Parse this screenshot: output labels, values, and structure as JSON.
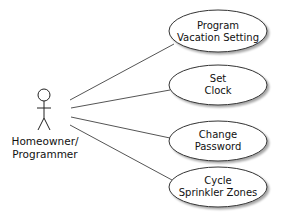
{
  "diagram": {
    "type": "use-case",
    "actor": {
      "label_line1": "Homeowner/",
      "label_line2": "Programmer"
    },
    "use_cases": [
      {
        "line1": "Program",
        "line2": "Vacation Setting"
      },
      {
        "line1": "Set",
        "line2": "Clock"
      },
      {
        "line1": "Change",
        "line2": "Password"
      },
      {
        "line1": "Cycle",
        "line2": "Sprinkler Zones"
      }
    ],
    "colors": {
      "stroke": "#333333",
      "fill": "#ffffff",
      "text": "#111111"
    }
  }
}
